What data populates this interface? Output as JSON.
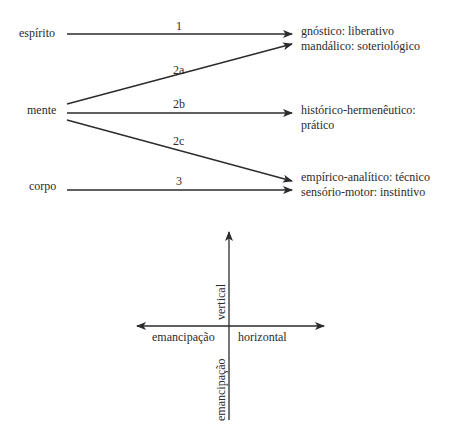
{
  "diagram": {
    "sources": [
      {
        "id": "espirito",
        "label": "espírito"
      },
      {
        "id": "mente",
        "label": "mente"
      },
      {
        "id": "corpo",
        "label": "corpo"
      }
    ],
    "edges": [
      {
        "label": "1",
        "from": "espírito",
        "to": "gnóstico: liberativo"
      },
      {
        "label": "2a",
        "from": "mente",
        "to": "mandálico: soteriológico"
      },
      {
        "label": "2b",
        "from": "mente",
        "to": "histórico-hermenêutico: prático"
      },
      {
        "label": "2c",
        "from": "mente",
        "to": "empírico-analítico: técnico"
      },
      {
        "label": "3",
        "from": "corpo",
        "to": "sensório-motor: instintivo"
      }
    ],
    "targets": {
      "t1": "gnóstico: liberativo",
      "t2": "mandálico: soteriológico",
      "t3_line1": "histórico-hermenêutico:",
      "t3_line2": "prático",
      "t4": "empírico-analítico: técnico",
      "t5": "sensório-motor: instintivo"
    }
  },
  "axes": {
    "vertical_up": "vertical",
    "vertical_down": "emancipação",
    "horizontal_left": "emancipação",
    "horizontal_right": "horizontal"
  },
  "colors": {
    "ink": "#2b2b2b",
    "background": "#ffffff"
  }
}
